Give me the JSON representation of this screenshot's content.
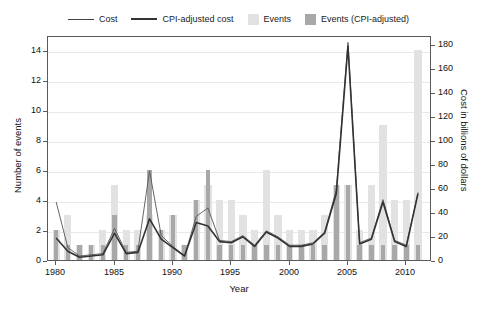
{
  "chart_data": {
    "type": "bar",
    "title": "",
    "xlabel": "Year",
    "ylabel": "Number of events",
    "y2label": "Cost in billions of dollars",
    "xlim": [
      1979.3,
      2012.2
    ],
    "ylim": [
      0,
      15
    ],
    "y2lim": [
      0,
      187.5
    ],
    "grid": true,
    "legend_position": "top-center",
    "x_ticks": [
      "1980",
      "1985",
      "1990",
      "1995",
      "2000",
      "2005",
      "2010"
    ],
    "x_tick_values": [
      1980,
      1985,
      1990,
      1995,
      2000,
      2005,
      2010
    ],
    "y_ticks": [
      "0",
      "2",
      "4",
      "6",
      "8",
      "10",
      "12",
      "14"
    ],
    "y_tick_values": [
      0,
      2,
      4,
      6,
      8,
      10,
      12,
      14
    ],
    "y2_ticks": [
      "0",
      "20",
      "40",
      "60",
      "80",
      "100",
      "120",
      "140",
      "160",
      "180"
    ],
    "y2_tick_values": [
      0,
      20,
      40,
      60,
      80,
      100,
      120,
      140,
      160,
      180
    ],
    "categories": [
      1980,
      1981,
      1982,
      1983,
      1984,
      1985,
      1986,
      1987,
      1988,
      1989,
      1990,
      1991,
      1992,
      1993,
      1994,
      1995,
      1996,
      1997,
      1998,
      1999,
      2000,
      2001,
      2002,
      2003,
      2004,
      2005,
      2006,
      2007,
      2008,
      2009,
      2010,
      2011
    ],
    "series": [
      {
        "name": "Events",
        "type": "bar",
        "color": "#e2e2e2",
        "axis": "left",
        "values": [
          2,
          3,
          1,
          1,
          2,
          5,
          2,
          2,
          3,
          2,
          3,
          1,
          4,
          5,
          4,
          4,
          3,
          2,
          6,
          3,
          2,
          2,
          2,
          3,
          5,
          5,
          2,
          5,
          9,
          4,
          4,
          14
        ]
      },
      {
        "name": "Events (CPI-adjusted)",
        "type": "bar",
        "color": "#a8a8a8",
        "axis": "left",
        "values": [
          2,
          1,
          1,
          1,
          1,
          3,
          1,
          1,
          6,
          2,
          3,
          1,
          4,
          6,
          1,
          1,
          1,
          1,
          1,
          1,
          1,
          1,
          1,
          1,
          5,
          5,
          1,
          1,
          1,
          1,
          1,
          1
        ]
      },
      {
        "name": "Cost",
        "type": "line",
        "color": "#555555",
        "axis": "right",
        "values": [
          50,
          12,
          5,
          6,
          7,
          28,
          8,
          9,
          76,
          22,
          13,
          5,
          38,
          45,
          18,
          17,
          22,
          14,
          26,
          21,
          14,
          14,
          16,
          25,
          60,
          183,
          16,
          20,
          52,
          18,
          14,
          58
        ]
      },
      {
        "name": "CPI-adjusted cost",
        "type": "line",
        "color": "#333333",
        "axis": "right",
        "values": [
          20,
          9,
          4,
          5,
          6,
          24,
          7,
          8,
          36,
          19,
          12,
          5,
          33,
          30,
          17,
          16,
          21,
          13,
          25,
          20,
          13,
          13,
          15,
          24,
          57,
          180,
          15,
          19,
          50,
          17,
          13,
          57
        ]
      }
    ]
  },
  "legend": {
    "items": [
      {
        "label": "Cost",
        "kind": "line-thin"
      },
      {
        "label": "CPI-adjusted cost",
        "kind": "line-thick"
      },
      {
        "label": "Events",
        "kind": "swatch-light"
      },
      {
        "label": "Events (CPI-adjusted)",
        "kind": "swatch-dark"
      }
    ]
  }
}
